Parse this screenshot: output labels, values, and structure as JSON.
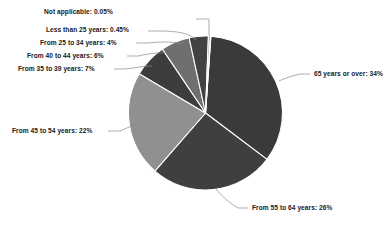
{
  "chart_data": {
    "type": "pie",
    "title": "",
    "subtitle": "",
    "xlabel": "",
    "ylabel": "",
    "legend_position": "none",
    "grid": false,
    "label_format": "{category}: {value}%",
    "categories": [
      "65 years or over",
      "From 55 to 64 years",
      "From 45 to 54 years",
      "From 35 to 39 years",
      "From 40 to 44 years",
      "From 25 to 34 years",
      "Less than 25 years",
      "Not applicable"
    ],
    "values": [
      34,
      26,
      22,
      7,
      6,
      4,
      0.45,
      0.05
    ],
    "colors": [
      "#3a3a3a",
      "#3f3f3f",
      "#909090",
      "#3d3d3d",
      "#6f6f6f",
      "#424242",
      "#adadad",
      "#d8d8d8"
    ],
    "slices": [
      {
        "label": "65 years or over: 34%",
        "category": "65 years or over",
        "value": 34,
        "display": "34%",
        "color": "#3a3a3a"
      },
      {
        "label": "From 55 to 64 years: 26%",
        "category": "From 55 to 64 years",
        "value": 26,
        "display": "26%",
        "color": "#3f3f3f"
      },
      {
        "label": "From 45 to 54 years: 22%",
        "category": "From 45 to 54 years",
        "value": 22,
        "display": "22%",
        "color": "#909090"
      },
      {
        "label": "From 35 to 39 years: 7%",
        "category": "From 35 to 39 years",
        "value": 7,
        "display": "7%",
        "color": "#3d3d3d"
      },
      {
        "label": "From 40 to 44 years: 6%",
        "category": "From 40 to 44 years",
        "value": 6,
        "display": "6%",
        "color": "#6f6f6f"
      },
      {
        "label": "From 25 to 34 years: 4%",
        "category": "From 25 to 34 years",
        "value": 4,
        "display": "4%",
        "color": "#424242"
      },
      {
        "label": "Less than 25 years: 0.45%",
        "category": "Less than 25 years",
        "value": 0.45,
        "display": "0.45%",
        "color": "#adadad"
      },
      {
        "label": "Not applicable: 0.05%",
        "category": "Not applicable",
        "value": 0.05,
        "display": "0.05%",
        "color": "#d8d8d8"
      }
    ]
  },
  "labels": {
    "not_applicable": "Not applicable: 0.05%",
    "less_than_25": "Less than 25 years: 0.45%",
    "from_25_to_34": "From 25 to 34 years: 4%",
    "from_40_to_44": "From 40 to 44 years: 6%",
    "from_35_to_39": "From 35 to 39 years: 7%",
    "from_45_to_54": "From 45 to 54 years: 22%",
    "from_55_to_64": "From 55 to 64 years: 26%",
    "age_65_or_over": "65 years or over: 34%"
  },
  "style": {
    "background": "#ffffff",
    "label_color": "#1a1a1a",
    "leader_color": "#8a8a8a",
    "slice_separator": "#ffffff"
  }
}
